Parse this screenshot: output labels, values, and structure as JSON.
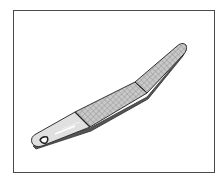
{
  "figure": {
    "icon": "nail-file-icon",
    "colors": {
      "frame": "#4a4a4a",
      "outline": "#333333",
      "file_fill": "#c8c8c8",
      "crosshatch": "#8c8c8c",
      "handle_fill": "#e2e2e2",
      "highlight": "#ffffff"
    }
  }
}
